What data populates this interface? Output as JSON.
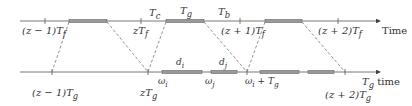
{
  "diagram": {
    "colors": {
      "axis": "#555555",
      "bar": "#888888",
      "bar_border": "#666666",
      "dash": "#777777",
      "text": "#333333"
    },
    "top_axis": {
      "label": "Time",
      "tick_labels": [
        "(z − 1)T",
        "zT",
        "(z + 1)T",
        "(z + 2)T"
      ],
      "tick_subscripts": [
        "f",
        "f",
        "f",
        "f"
      ],
      "segment_labels": {
        "tc": "T",
        "tc_sub": "c",
        "tg": "T",
        "tg_sub": "g",
        "tb": "T",
        "tb_sub": "b"
      }
    },
    "bottom_axis": {
      "label": "time",
      "label_prefix": "T",
      "label_prefix_sub": "g",
      "tick_labels": [
        "(z − 1)T",
        "zT",
        "(z + 2)T"
      ],
      "tick_subscripts": [
        "g",
        "g",
        "g"
      ],
      "omega_i": "ω",
      "omega_i_sub": "i",
      "omega_j": "ω",
      "omega_j_sub": "j",
      "omega_i_plus": "ω",
      "omega_i_plus_sub": "i",
      "omega_i_plus_suffix": " + T",
      "omega_i_plus_suffix_sub": "g",
      "d_i": "d",
      "d_i_sub": "i",
      "d_j": "d",
      "d_j_sub": "j"
    }
  }
}
